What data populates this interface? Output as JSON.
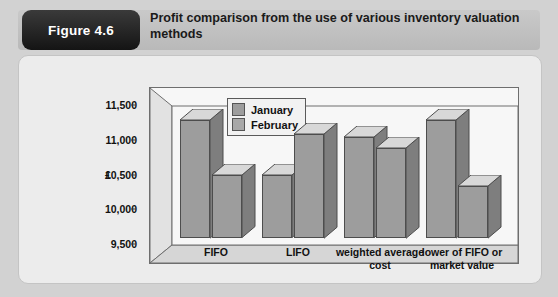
{
  "figure": {
    "badge": "Figure 4.6",
    "title": "Profit  comparison from the use of various inventory valuation methods"
  },
  "colors": {
    "page_background": "#d2d2d2",
    "card_background": "#ececec",
    "plot_background": "#f7f7f7",
    "bar_front": "#9d9d9d",
    "bar_top": "#d8d8d8",
    "bar_side": "#7e7e7e",
    "badge_background": "#141414",
    "text": "#111111"
  },
  "chart_data": {
    "type": "bar",
    "title": "Profit  comparison from the use of various inventory valuation methods",
    "xlabel": "",
    "ylabel": "£",
    "categories": [
      "FIFO",
      "LIFO",
      "weighted average cost",
      "lower of FIFO or market value"
    ],
    "series": [
      {
        "name": "January",
        "values": [
          11200,
          10400,
          10950,
          11200
        ]
      },
      {
        "name": "February",
        "values": [
          10400,
          11000,
          10800,
          10250
        ]
      }
    ],
    "ylim": [
      9500,
      11500
    ],
    "yticks": [
      9500,
      10000,
      10500,
      11000,
      11500
    ],
    "ytick_labels": [
      "9,500",
      "10,000",
      "10,500",
      "11,000",
      "11,500"
    ],
    "grid": false,
    "legend_position": "top-center",
    "style": "3d-column"
  }
}
